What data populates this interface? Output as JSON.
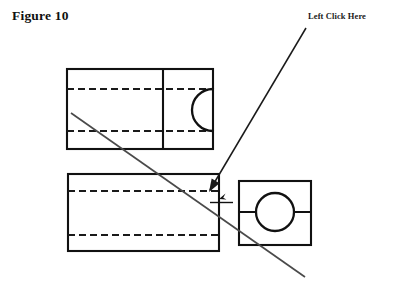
{
  "page": {
    "background_color": "#ffffff",
    "width": 393,
    "height": 288
  },
  "figure": {
    "title": "Figure 10",
    "title_color": "#101010"
  },
  "annotation": {
    "label": "Left Click Here",
    "label_color": "#1a1a1a",
    "leader_line": {
      "from_x": 306,
      "from_y": 28,
      "to_x": 210,
      "to_y": 190,
      "color": "#1a1a1a"
    },
    "arrowhead": {
      "x": 209,
      "y": 192,
      "direction": "down-left"
    },
    "target_marker": {
      "x": 219,
      "y": 199,
      "name": "click-target-cursor"
    }
  },
  "drawing": {
    "line_color": "#111111",
    "dashed_color": "#1a1a1a",
    "section_line_color": "#3c3c3c",
    "views": [
      {
        "name": "top-view",
        "type": "rectangle-with-arc",
        "x": 67,
        "y": 69,
        "width": 146,
        "height": 80,
        "divider_x": 163,
        "hidden_lines_y": [
          89,
          131
        ],
        "arc": {
          "center_x": 213,
          "center_y": 110,
          "radius": 21,
          "opening": "right"
        }
      },
      {
        "name": "front-view",
        "type": "rectangle",
        "x": 68,
        "y": 174,
        "width": 151,
        "height": 77,
        "hidden_lines_y": [
          191,
          235
        ]
      },
      {
        "name": "side-view",
        "type": "square-with-circle",
        "x": 239,
        "y": 181,
        "width": 72,
        "height": 64,
        "centerline_y": 212,
        "circle": {
          "center_x": 275,
          "center_y": 212,
          "radius": 19
        }
      }
    ],
    "cutting_plane_line": {
      "from_x": 71,
      "from_y": 113,
      "to_x": 305,
      "to_y": 277,
      "color": "#4a4a4a"
    }
  }
}
